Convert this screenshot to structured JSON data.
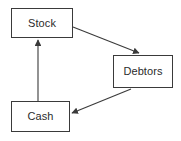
{
  "diagram": {
    "type": "flow-diagram",
    "background_color": "#ffffff",
    "node_border_color": "#3a3a3a",
    "node_fill_color": "#ffffff",
    "arrow_color": "#3a3a3a",
    "label_color": "#2b2b2b",
    "nodes": [
      {
        "id": "stock",
        "label": "Stock",
        "x": 11,
        "y": 8,
        "width": 62,
        "height": 30
      },
      {
        "id": "debtors",
        "label": "Debtors",
        "x": 113,
        "y": 55,
        "width": 60,
        "height": 33
      },
      {
        "id": "cash",
        "label": "Cash",
        "x": 11,
        "y": 101,
        "width": 59,
        "height": 31
      }
    ],
    "edges": [
      {
        "id": "stock-to-debtors",
        "from": "stock",
        "to": "debtors",
        "label": "",
        "style": "solid",
        "arrowhead": "filled-triangle"
      },
      {
        "id": "debtors-to-cash",
        "from": "debtors",
        "to": "cash",
        "label": "",
        "style": "solid",
        "arrowhead": "filled-triangle"
      },
      {
        "id": "cash-to-stock",
        "from": "cash",
        "to": "stock",
        "label": "",
        "style": "solid",
        "arrowhead": "filled-triangle"
      }
    ]
  }
}
